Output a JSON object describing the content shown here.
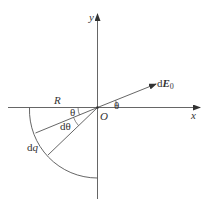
{
  "diagram": {
    "type": "electric-field-geometry",
    "colors": {
      "line": "#555555",
      "text": "#333333",
      "background": "#ffffff"
    },
    "axes": {
      "x_label": "x",
      "y_label": "y",
      "origin_label": "O"
    },
    "arc": {
      "radius_label": "R",
      "charge_element_label": "dq"
    },
    "angles": {
      "theta_left": "θ",
      "dtheta": "dθ",
      "theta_right": "θ"
    },
    "vector": {
      "label_prefix": "d",
      "label_main": "E",
      "label_sub": "0"
    }
  }
}
